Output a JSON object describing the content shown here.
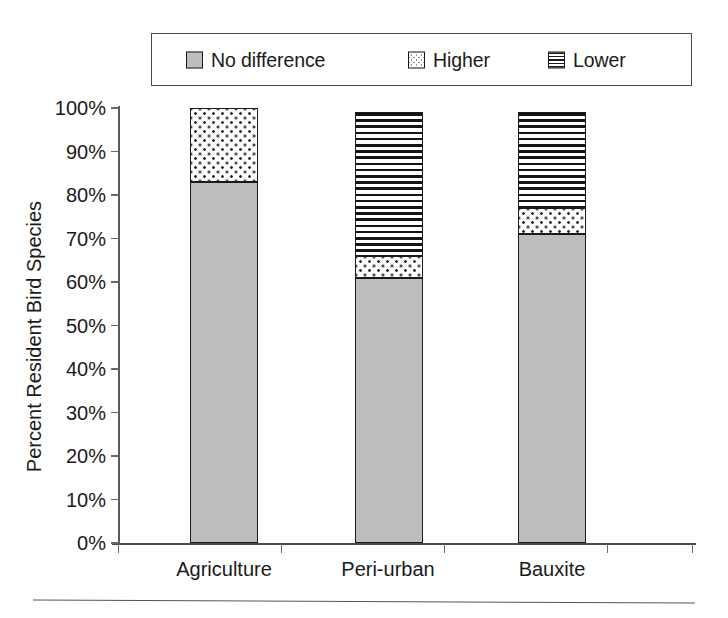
{
  "chart_data": {
    "type": "bar",
    "subtype": "stacked-vertical-100",
    "title": "",
    "xlabel": "",
    "ylabel": "Percent Resident Bird Species",
    "categories": [
      "Agriculture",
      "Peri-urban",
      "Bauxite"
    ],
    "series": [
      {
        "name": "No difference",
        "values": [
          83,
          61,
          71
        ],
        "pattern": "solid-gray",
        "color": "#bdbdbd"
      },
      {
        "name": "Higher",
        "values": [
          17,
          5,
          6
        ],
        "pattern": "dotted",
        "color": "#ffffff"
      },
      {
        "name": "Lower",
        "values": [
          0,
          33,
          22
        ],
        "pattern": "horizontal-lines",
        "color": "#ffffff"
      }
    ],
    "totals": [
      100,
      99,
      99
    ],
    "ylim": [
      0,
      100
    ],
    "ytick_values": [
      0,
      10,
      20,
      30,
      40,
      50,
      60,
      70,
      80,
      90,
      100
    ],
    "ytick_labels": [
      "0%",
      "10%",
      "20%",
      "30%",
      "40%",
      "50%",
      "60%",
      "70%",
      "80%",
      "90%",
      "100%"
    ],
    "grid": false,
    "legend_position": "top",
    "legend_entries": [
      "No difference",
      "Higher",
      "Lower"
    ]
  },
  "legend": {
    "items": [
      {
        "label": "No difference",
        "swatch": "solid-gray-swatch-icon"
      },
      {
        "label": "Higher",
        "swatch": "dotted-swatch-icon"
      },
      {
        "label": "Lower",
        "swatch": "horizontal-lines-swatch-icon"
      }
    ]
  },
  "axes": {
    "y_title": "Percent Resident Bird Species",
    "y_labels": [
      "100%",
      "90%",
      "80%",
      "70%",
      "60%",
      "50%",
      "40%",
      "30%",
      "20%",
      "10%",
      "0%"
    ],
    "x_labels": [
      "Agriculture",
      "Peri-urban",
      "Bauxite"
    ]
  }
}
